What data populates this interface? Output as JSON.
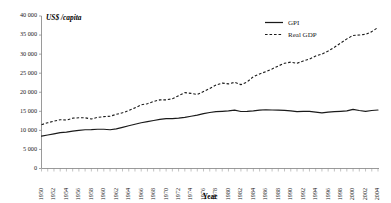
{
  "chart_data": {
    "type": "line",
    "title": "",
    "xlabel": "Year",
    "ylabel": "",
    "unit_label": "US$ /capita",
    "xlim": [
      1950,
      2004
    ],
    "ylim": [
      0,
      40000
    ],
    "grid": false,
    "legend_position": "top-right",
    "ytick_labels": [
      "0",
      "5 000",
      "10 000",
      "15 000",
      "20 000",
      "25 000",
      "30 000",
      "35 000",
      "40 000"
    ],
    "ytick_values": [
      0,
      5000,
      10000,
      15000,
      20000,
      25000,
      30000,
      35000,
      40000
    ],
    "xtick_labels": [
      "1950",
      "1952",
      "1954",
      "1956",
      "1958",
      "1960",
      "1962",
      "1964",
      "1966",
      "1968",
      "1970",
      "1972",
      "1974",
      "1976",
      "1978",
      "1980",
      "1982",
      "1984",
      "1986",
      "1988",
      "1990",
      "1992",
      "1994",
      "1996",
      "1998",
      "2000",
      "2002",
      "2004"
    ],
    "x": [
      1950,
      1951,
      1952,
      1953,
      1954,
      1955,
      1956,
      1957,
      1958,
      1959,
      1960,
      1961,
      1962,
      1963,
      1964,
      1965,
      1966,
      1967,
      1968,
      1969,
      1970,
      1971,
      1972,
      1973,
      1974,
      1975,
      1976,
      1977,
      1978,
      1979,
      1980,
      1981,
      1982,
      1983,
      1984,
      1985,
      1986,
      1987,
      1988,
      1989,
      1990,
      1991,
      1992,
      1993,
      1994,
      1995,
      1996,
      1997,
      1998,
      1999,
      2000,
      2001,
      2002,
      2003,
      2004
    ],
    "series": [
      {
        "name": "GPI",
        "style": "solid",
        "color": "#1a1a1a",
        "values": [
          8500,
          8800,
          9100,
          9400,
          9550,
          9800,
          10000,
          10150,
          10200,
          10300,
          10300,
          10150,
          10400,
          10800,
          11200,
          11600,
          12000,
          12300,
          12600,
          12900,
          13100,
          13100,
          13200,
          13400,
          13700,
          14000,
          14400,
          14700,
          14900,
          15000,
          15100,
          15300,
          14950,
          15000,
          15100,
          15300,
          15400,
          15350,
          15300,
          15250,
          15100,
          14900,
          15000,
          15000,
          14800,
          14600,
          14800,
          14900,
          15000,
          15100,
          15500,
          15200,
          15000,
          15200,
          15350
        ],
        "start_value": 8500,
        "end_value": 15350,
        "peak_value": 15500
      },
      {
        "name": "Real GDP",
        "style": "dashed",
        "color": "#1a1a1a",
        "values": [
          11500,
          12000,
          12400,
          12800,
          12700,
          13200,
          13300,
          13300,
          13000,
          13400,
          13600,
          13700,
          14200,
          14600,
          15200,
          15900,
          16700,
          17000,
          17600,
          18000,
          18000,
          18300,
          19100,
          19900,
          19700,
          19400,
          20200,
          21000,
          21900,
          22400,
          22200,
          22600,
          22000,
          22700,
          24100,
          24800,
          25400,
          26100,
          26900,
          27600,
          27900,
          27600,
          28200,
          28700,
          29500,
          30000,
          30800,
          31800,
          32900,
          34000,
          34900,
          35000,
          35200,
          35900,
          37000
        ],
        "start_value": 11500,
        "end_value": 37000
      }
    ]
  },
  "legend": {
    "items": [
      {
        "label": "GPI",
        "style": "solid"
      },
      {
        "label": "Real GDP",
        "style": "dashed"
      }
    ]
  }
}
